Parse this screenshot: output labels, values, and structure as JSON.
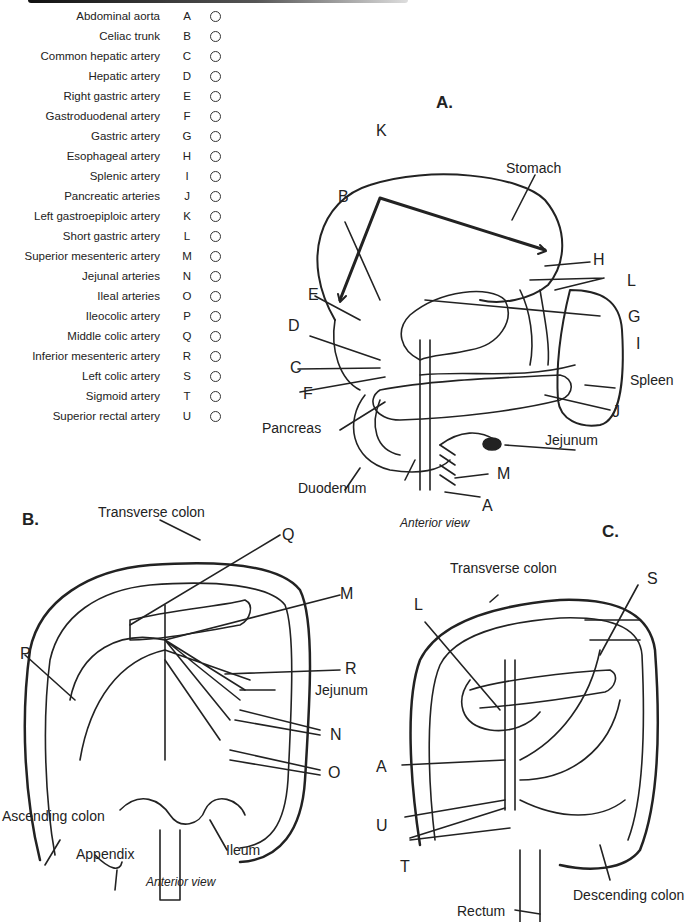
{
  "legend": {
    "items": [
      {
        "name": "Abdominal aorta",
        "letter": "A"
      },
      {
        "name": "Celiac trunk",
        "letter": "B"
      },
      {
        "name": "Common hepatic artery",
        "letter": "C"
      },
      {
        "name": "Hepatic artery",
        "letter": "D"
      },
      {
        "name": "Right gastric artery",
        "letter": "E"
      },
      {
        "name": "Gastroduodenal artery",
        "letter": "F"
      },
      {
        "name": "Gastric artery",
        "letter": "G"
      },
      {
        "name": "Esophageal artery",
        "letter": "H"
      },
      {
        "name": "Splenic artery",
        "letter": "I"
      },
      {
        "name": "Pancreatic arteries",
        "letter": "J"
      },
      {
        "name": "Left gastroepiploic artery",
        "letter": "K"
      },
      {
        "name": "Short gastric artery",
        "letter": "L"
      },
      {
        "name": "Superior mesenteric artery",
        "letter": "M"
      },
      {
        "name": "Jejunal arteries",
        "letter": "N"
      },
      {
        "name": "Ileal arteries",
        "letter": "O"
      },
      {
        "name": "Ileocolic artery",
        "letter": "P"
      },
      {
        "name": "Middle colic artery",
        "letter": "Q"
      },
      {
        "name": "Inferior mesenteric artery",
        "letter": "R"
      },
      {
        "name": "Left colic artery",
        "letter": "S"
      },
      {
        "name": "Sigmoid artery",
        "letter": "T"
      },
      {
        "name": "Superior rectal artery",
        "letter": "U"
      }
    ]
  },
  "panels": {
    "a": {
      "title": "A.",
      "view": "Anterior view",
      "labels": {
        "K": "K",
        "stomach": "Stomach",
        "B": "B",
        "H": "H",
        "L": "L",
        "E": "E",
        "G": "G",
        "D": "D",
        "I": "I",
        "C": "C",
        "spleen": "Spleen",
        "F": "F",
        "J": "J",
        "pancreas": "Pancreas",
        "jejunum": "Jejunum",
        "M": "M",
        "duodenum": "Duodenum",
        "A": "A"
      }
    },
    "b": {
      "title": "B.",
      "view": "Anterior view",
      "labels": {
        "transverse_colon": "Transverse colon",
        "Q": "Q",
        "M": "M",
        "P": "P",
        "R": "R",
        "jejunum": "Jejunum",
        "N": "N",
        "O": "O",
        "ascending_colon": "Ascending colon",
        "appendix": "Appendix",
        "ileum": "Ileum"
      }
    },
    "c": {
      "title": "C.",
      "labels": {
        "transverse_colon": "Transverse colon",
        "S": "S",
        "L": "L",
        "A": "A",
        "U": "U",
        "T": "T",
        "descending_colon": "Descending colon",
        "rectum": "Rectum"
      }
    }
  }
}
